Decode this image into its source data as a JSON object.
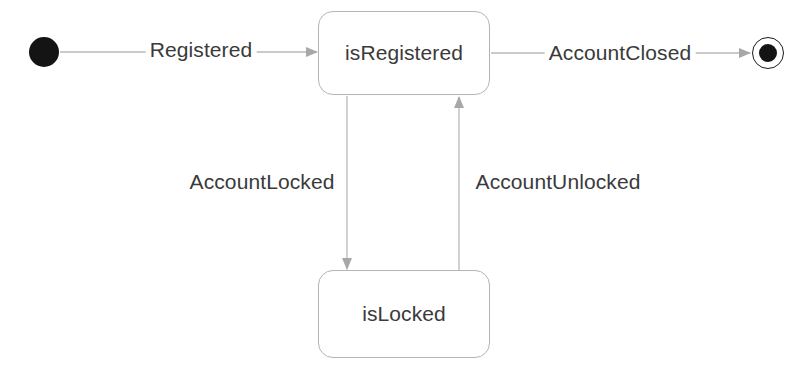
{
  "diagram": {
    "type": "uml-state-machine",
    "background_color": "#ffffff",
    "line_color": "#b8b8b8",
    "arrow_color": "#a8a8a8",
    "text_color": "#3a3a3a",
    "node_fill_color": "#141414",
    "states": [
      {
        "id": "initial",
        "kind": "initial-pseudostate",
        "label": "",
        "cx": 44,
        "cy": 52,
        "r": 15
      },
      {
        "id": "isRegistered",
        "kind": "state",
        "label": "isRegistered",
        "x": 318,
        "y": 11,
        "width": 172,
        "height": 84
      },
      {
        "id": "isLocked",
        "kind": "state",
        "label": "isLocked",
        "x": 318,
        "y": 270,
        "width": 172,
        "height": 88
      },
      {
        "id": "final",
        "kind": "final-state",
        "label": "",
        "cx": 768,
        "cy": 53,
        "outer_r": 16,
        "inner_r": 9
      }
    ],
    "transitions": [
      {
        "id": "t1",
        "label": "Registered",
        "from": "initial",
        "to": "isRegistered",
        "label_x": 201,
        "label_y": 50
      },
      {
        "id": "t2",
        "label": "AccountClosed",
        "from": "isRegistered",
        "to": "final",
        "label_x": 620,
        "label_y": 53
      },
      {
        "id": "t3",
        "label": "AccountLocked",
        "from": "isRegistered",
        "to": "isLocked",
        "label_x": 262,
        "label_y": 182
      },
      {
        "id": "t4",
        "label": "AccountUnlocked",
        "from": "isLocked",
        "to": "isRegistered",
        "label_x": 558,
        "label_y": 182
      }
    ]
  }
}
